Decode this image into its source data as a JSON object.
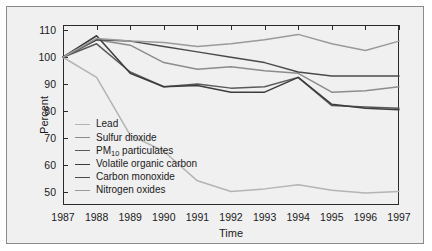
{
  "chart_data": {
    "type": "line",
    "title": "",
    "xlabel": "Time",
    "ylabel": "Percent",
    "x": [
      1987,
      1988,
      1989,
      1990,
      1991,
      1992,
      1993,
      1994,
      1995,
      1996,
      1997
    ],
    "xlim": [
      1987,
      1997
    ],
    "ylim": [
      45,
      112
    ],
    "yticks": [
      110,
      100,
      90,
      80,
      70,
      60,
      50
    ],
    "xticks": [
      "1987",
      "1988",
      "1989",
      "1990",
      "1991",
      "1992",
      "1993",
      "1994",
      "1995",
      "1996",
      "1997"
    ],
    "grid": false,
    "legend_position": "lower-left-inside",
    "series": [
      {
        "name": "Lead",
        "color": "#b4b4b4",
        "values": [
          100,
          92.5,
          71,
          65,
          54,
          50,
          51,
          52.5,
          50.5,
          49.5,
          50
        ]
      },
      {
        "name": "Sulfur dioxide",
        "color": "#8c8c8c",
        "values": [
          100,
          106.5,
          104.5,
          98,
          95.5,
          96.5,
          95,
          94,
          87,
          87.5,
          89
        ]
      },
      {
        "name": "PM10 particulates",
        "color": "#5a5a5a",
        "values": [
          100,
          105,
          94.5,
          89,
          90,
          88.5,
          89,
          92.5,
          82,
          81.5,
          81
        ]
      },
      {
        "name": "Volatile organic carbon",
        "color": "#3c3c3c",
        "values": [
          100,
          108,
          94,
          89,
          89.5,
          87,
          87,
          92.5,
          82.5,
          81,
          80.5
        ]
      },
      {
        "name": "Carbon monoxide",
        "color": "#4a4a4a",
        "values": [
          100,
          106.5,
          106,
          104,
          102,
          100,
          98,
          94.5,
          93,
          93,
          93
        ]
      },
      {
        "name": "Nitrogen oxides",
        "color": "#9a9a9a",
        "values": [
          100,
          107,
          106,
          105.5,
          104,
          105,
          106.5,
          108.5,
          105,
          102.5,
          106
        ]
      }
    ],
    "legend_entries": [
      {
        "label": "Lead",
        "has_subscript": false,
        "color": "#b4b4b4"
      },
      {
        "label": "Sulfur dioxide",
        "has_subscript": false,
        "color": "#8c8c8c"
      },
      {
        "label": "PM",
        "subscript": "10",
        "label_tail": " particulates",
        "has_subscript": true,
        "color": "#5a5a5a"
      },
      {
        "label": "Volatile organic carbon",
        "has_subscript": false,
        "color": "#3c3c3c"
      },
      {
        "label": "Carbon monoxide",
        "has_subscript": false,
        "color": "#4a4a4a"
      },
      {
        "label": "Nitrogen oxides",
        "has_subscript": false,
        "color": "#9a9a9a"
      }
    ]
  },
  "figure": {
    "background_color": "#f0f0f0",
    "border_color": "#8a8a8a",
    "axis_color": "#2a2a2a"
  }
}
